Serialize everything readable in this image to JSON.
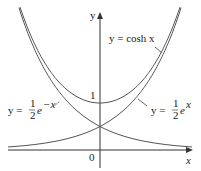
{
  "chart_data": {
    "type": "line",
    "title": "",
    "xlabel": "x",
    "ylabel": "y",
    "origin_label": "0",
    "y_tick_label": "1",
    "grid": false,
    "xlim": [
      -2.2,
      2.2
    ],
    "ylim": [
      -0.2,
      3.2
    ],
    "series": [
      {
        "name": "y = cosh x",
        "function": "cosh(x)",
        "points": [
          [
            -1.8,
            3.11
          ],
          [
            -1.5,
            2.35
          ],
          [
            -1,
            1.54
          ],
          [
            -0.5,
            1.13
          ],
          [
            0,
            1
          ],
          [
            0.5,
            1.13
          ],
          [
            1,
            1.54
          ],
          [
            1.5,
            2.35
          ],
          [
            1.8,
            3.11
          ]
        ]
      },
      {
        "name": "y = 1/2 e^x",
        "function": "0.5*exp(x)",
        "points": [
          [
            -2,
            0.07
          ],
          [
            -1,
            0.18
          ],
          [
            0,
            0.5
          ],
          [
            1,
            1.36
          ],
          [
            1.5,
            2.24
          ],
          [
            1.85,
            3.18
          ]
        ]
      },
      {
        "name": "y = 1/2 e^-x",
        "function": "0.5*exp(-x)",
        "points": [
          [
            -1.85,
            3.18
          ],
          [
            -1.5,
            2.24
          ],
          [
            -1,
            1.36
          ],
          [
            0,
            0.5
          ],
          [
            1,
            0.18
          ],
          [
            2,
            0.07
          ]
        ]
      }
    ],
    "annotations": [
      {
        "text": "y = cosh x",
        "arrow_to": "cosh curve right branch"
      },
      {
        "text": "y = 1/2 e^x",
        "arrow_to": "exp curve right"
      },
      {
        "text": "y = 1/2 e^-x",
        "arrow_to": "exp(-x) curve left"
      }
    ]
  },
  "labels": {
    "y_axis": "y",
    "x_axis": "x",
    "origin": "0",
    "one": "1",
    "cosh": "y = cosh x",
    "y_eq": "y =",
    "half_num": "1",
    "half_den": "2",
    "e": "e",
    "exp_pos": "x",
    "exp_neg": "−x"
  }
}
